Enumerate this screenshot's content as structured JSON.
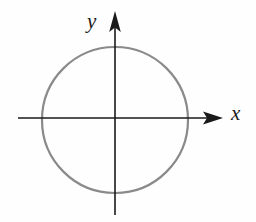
{
  "figure": {
    "kind": "coordinate-plane-with-circle",
    "background_color": "#fefefe",
    "width": 256,
    "height": 222
  },
  "axes": {
    "x_axis": {
      "label": "x",
      "color": "#1a1a1a",
      "stroke_width": 1.6,
      "y_position": 118,
      "x_start": 18,
      "x_end": 212,
      "arrow": "right",
      "arrow_tip_x": 223,
      "label_x": 231,
      "label_y": 103
    },
    "y_axis": {
      "label": "y",
      "color": "#1a1a1a",
      "stroke_width": 1.6,
      "x_position": 115,
      "y_start": 215,
      "y_end": 22,
      "arrow": "up",
      "arrow_tip_y": 11,
      "label_x": 87,
      "label_y": 11
    }
  },
  "chart_data": {
    "type": "scatter",
    "title": "",
    "xlabel": "x",
    "ylabel": "y",
    "shapes": [
      {
        "name": "circle",
        "type": "circle",
        "center_x": 0,
        "center_y": 0,
        "radius": 73,
        "center_px_x": 115,
        "center_px_y": 120,
        "radius_px": 73,
        "stroke_color": "#8a8a8a",
        "stroke_width": 2.2,
        "fill": "none"
      }
    ],
    "x": [],
    "values": [],
    "grid": false,
    "legend": false,
    "annotations": []
  },
  "labels": {
    "y_label": "y",
    "x_label": "x"
  },
  "colors": {
    "circle_stroke": "#8a8a8a",
    "axis_stroke": "#1a1a1a",
    "background": "#fefefe"
  }
}
